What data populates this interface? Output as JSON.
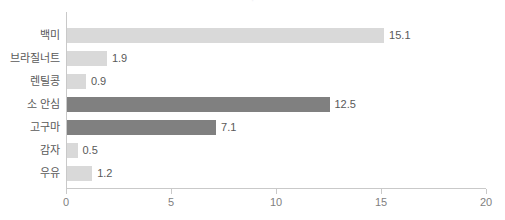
{
  "chart_data": {
    "type": "bar",
    "orientation": "horizontal",
    "title": "",
    "xlabel": "",
    "ylabel": "",
    "xlim": [
      0,
      20
    ],
    "xticks": [
      0,
      5,
      10,
      15,
      20
    ],
    "xtick_labels": [
      "0",
      "5",
      "10",
      "15",
      "20"
    ],
    "grid": false,
    "legend": "none",
    "categories": [
      "백미",
      "브라질너트",
      "렌틸콩",
      "소 안심",
      "고구마",
      "감자",
      "우유"
    ],
    "values": [
      15.1,
      1.9,
      0.9,
      12.5,
      7.1,
      0.5,
      1.2
    ],
    "value_labels": [
      "15.1",
      "1.9",
      "0.9",
      "12.5",
      "7.1",
      "0.5",
      "1.2"
    ],
    "bar_colors": [
      "#d9d9d9",
      "#d9d9d9",
      "#d9d9d9",
      "#808080",
      "#808080",
      "#d9d9d9",
      "#d9d9d9"
    ],
    "bars": [
      {
        "category": "백미",
        "value": 15.1,
        "label": "15.1",
        "color": "#d9d9d9"
      },
      {
        "category": "브라질너트",
        "value": 1.9,
        "label": "1.9",
        "color": "#d9d9d9"
      },
      {
        "category": "렌틸콩",
        "value": 0.9,
        "label": "0.9",
        "color": "#d9d9d9"
      },
      {
        "category": "소 안심",
        "value": 12.5,
        "label": "12.5",
        "color": "#808080"
      },
      {
        "category": "고구마",
        "value": 7.1,
        "label": "7.1",
        "color": "#808080"
      },
      {
        "category": "감자",
        "value": 0.5,
        "label": "0.5",
        "color": "#d9d9d9"
      },
      {
        "category": "우유",
        "value": 1.2,
        "label": "1.2",
        "color": "#d9d9d9"
      }
    ]
  },
  "colors": {
    "bar_light": "#d9d9d9",
    "bar_dark": "#808080",
    "axis": "#c9c9c9",
    "text": "#595959",
    "tick_text": "#7f7f7f",
    "background": "#ffffff"
  },
  "title_remnant": "·"
}
